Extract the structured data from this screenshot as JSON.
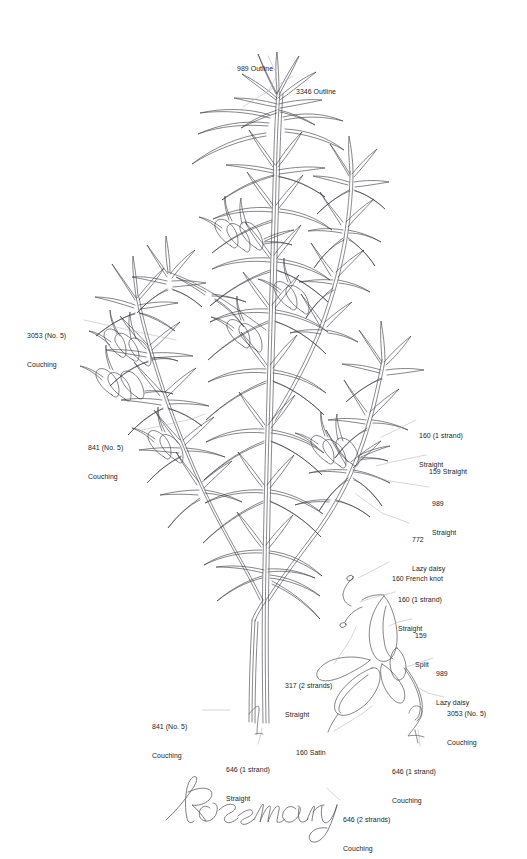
{
  "document": {
    "kind": "embroidery-pattern-diagram",
    "subject": "Rosemary",
    "title_script": "Rosemary",
    "background_color": "#ffffff",
    "ink_color": "#3a3a42",
    "leader_color": "#b4b4bc",
    "text_color": "#1c1c1c"
  },
  "figure_numbers": [
    {
      "id": "fig-1",
      "label": "1"
    },
    {
      "id": "fig-2",
      "label": "2"
    }
  ],
  "annotations": [
    {
      "id": "989-outline",
      "thread": "989",
      "stitch": "Outline",
      "line1": "989 Outline",
      "line2": "",
      "align": "left",
      "x": 237,
      "y": 45,
      "leader": [
        [
          268,
          56
        ],
        [
          277,
          75
        ],
        [
          268,
          92
        ]
      ]
    },
    {
      "id": "3346-outline",
      "thread": "3346",
      "stitch": "Outline",
      "line1": "3346 Outline",
      "line2": "",
      "align": "left",
      "x": 296,
      "y": 68,
      "leader": [
        [
          293,
          76
        ],
        [
          252,
          101
        ],
        [
          243,
          107
        ]
      ]
    },
    {
      "id": "3053-no5-couching",
      "thread": "3053 (No. 5)",
      "stitch": "Couching",
      "line1": "3053 (No. 5)",
      "line2": "Couching",
      "align": "left",
      "x": 27,
      "y": 312,
      "leader": [
        [
          84,
          320
        ],
        [
          152,
          335
        ],
        [
          176,
          340
        ]
      ]
    },
    {
      "id": "841-no5-couching-upper",
      "thread": "841 (No. 5)",
      "stitch": "Couching",
      "line1": "841 (No. 5)",
      "line2": "Couching",
      "align": "left",
      "x": 88,
      "y": 424,
      "leader": [
        [
          142,
          430
        ],
        [
          192,
          419
        ],
        [
          205,
          414
        ]
      ]
    },
    {
      "id": "160-1strand-straight-main",
      "thread": "160 (1 strand)",
      "stitch": "Straight",
      "line1": "160 (1 strand)",
      "line2": "Straight",
      "align": "left",
      "x": 419,
      "y": 412,
      "leader": [
        [
          416,
          420
        ],
        [
          392,
          432
        ],
        [
          381,
          437
        ]
      ]
    },
    {
      "id": "159-straight",
      "thread": "159",
      "stitch": "Straight",
      "line1": "159 Straight",
      "line2": "",
      "align": "left",
      "x": 429,
      "y": 448,
      "leader": [
        [
          426,
          455
        ],
        [
          392,
          462
        ],
        [
          376,
          466
        ]
      ]
    },
    {
      "id": "989-straight",
      "thread": "989",
      "stitch": "Straight",
      "line1": "989",
      "line2": "Straight",
      "align": "left",
      "x": 432,
      "y": 480,
      "leader": [
        [
          429,
          487
        ],
        [
          390,
          481
        ],
        [
          362,
          473
        ]
      ]
    },
    {
      "id": "772-lazy-daisy",
      "thread": "772",
      "stitch": "Lazy daisy",
      "line1": "772",
      "line2": "Lazy daisy",
      "align": "left",
      "x": 412,
      "y": 516,
      "leader": [
        [
          409,
          523
        ],
        [
          382,
          513
        ],
        [
          356,
          494
        ]
      ]
    },
    {
      "id": "160-french-knot",
      "thread": "160",
      "stitch": "French knot",
      "line1": "160 French knot",
      "line2": "",
      "align": "left",
      "x": 392,
      "y": 555,
      "leader": [
        [
          389,
          562
        ],
        [
          370,
          572
        ],
        [
          358,
          578
        ]
      ]
    },
    {
      "id": "160-1strand-straight-detail",
      "thread": "160 (1 strand)",
      "stitch": "Straight",
      "line1": "160 (1 strand)",
      "line2": "Straight",
      "align": "left",
      "x": 398,
      "y": 576,
      "leader": [
        [
          395,
          592
        ],
        [
          372,
          598
        ],
        [
          360,
          602
        ]
      ]
    },
    {
      "id": "159-split",
      "thread": "159",
      "stitch": "Split",
      "line1": "159",
      "line2": "Split",
      "align": "left",
      "x": 415,
      "y": 612,
      "leader": [
        [
          412,
          619
        ],
        [
          398,
          622
        ],
        [
          389,
          626
        ]
      ]
    },
    {
      "id": "989-lazy-daisy",
      "thread": "989",
      "stitch": "Lazy daisy",
      "line1": "989",
      "line2": "Lazy daisy",
      "align": "left",
      "x": 436,
      "y": 650,
      "leader": [
        [
          433,
          658
        ],
        [
          415,
          664
        ],
        [
          404,
          668
        ]
      ]
    },
    {
      "id": "3053-no5-couching-detail",
      "thread": "3053 (No. 5)",
      "stitch": "Couching",
      "line1": "3053 (No. 5)",
      "line2": "Couching",
      "align": "left",
      "x": 447,
      "y": 690,
      "leader": [
        [
          444,
          697
        ],
        [
          428,
          693
        ],
        [
          419,
          688
        ]
      ]
    },
    {
      "id": "317-2strands-straight",
      "thread": "317 (2 strands)",
      "stitch": "Straight",
      "line1": "317 (2 strands)",
      "line2": "Straight",
      "align": "left",
      "x": 285,
      "y": 662,
      "leader": [
        [
          334,
          664
        ],
        [
          350,
          640
        ],
        [
          356,
          627
        ]
      ]
    },
    {
      "id": "160-satin",
      "thread": "160",
      "stitch": "Satin",
      "line1": "160 Satin",
      "line2": "",
      "align": "left",
      "x": 296,
      "y": 729,
      "leader": [
        [
          334,
          731
        ],
        [
          362,
          714
        ],
        [
          372,
          706
        ]
      ]
    },
    {
      "id": "841-no5-couching-lower",
      "thread": "841 (No. 5)",
      "stitch": "Couching",
      "line1": "841 (No. 5)",
      "line2": "Couching",
      "align": "left",
      "x": 152,
      "y": 703,
      "leader": [
        [
          203,
          710
        ],
        [
          222,
          710
        ],
        [
          230,
          710
        ]
      ]
    },
    {
      "id": "646-1strand-straight",
      "thread": "646 (1 strand)",
      "stitch": "Straight",
      "line1": "646 (1 strand)",
      "line2": "Straight",
      "align": "left",
      "x": 226,
      "y": 746,
      "leader": [
        [
          258,
          744
        ],
        [
          261,
          734
        ],
        [
          262,
          728
        ]
      ]
    },
    {
      "id": "646-1strand-couching",
      "thread": "646 (1 strand)",
      "stitch": "Couching",
      "line1": "646 (1 strand)",
      "line2": "Couching",
      "align": "left",
      "x": 392,
      "y": 748,
      "leader": [
        [
          420,
          746
        ],
        [
          419,
          736
        ],
        [
          418,
          730
        ]
      ]
    },
    {
      "id": "646-2strands-couching",
      "thread": "646 (2 strands)",
      "stitch": "Couching",
      "line1": "646 (2 strands)",
      "line2": "Couching",
      "align": "left",
      "x": 343,
      "y": 796,
      "leader": [
        [
          340,
          800
        ],
        [
          332,
          793
        ],
        [
          327,
          788
        ]
      ]
    }
  ]
}
